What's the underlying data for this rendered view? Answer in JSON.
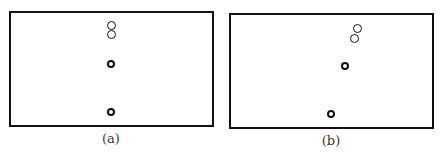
{
  "panels": [
    {
      "id": "a",
      "label": "(a)",
      "box": {
        "left": 9,
        "top": 11,
        "width": 205,
        "height": 116
      },
      "label_pos": {
        "x": 111,
        "y": 131
      },
      "circles": [
        {
          "cx": 111,
          "cy": 25,
          "r": 4.5,
          "stroke": 1.5
        },
        {
          "cx": 111,
          "cy": 34,
          "r": 4.5,
          "stroke": 1.5
        },
        {
          "cx": 111,
          "cy": 64,
          "r": 4,
          "stroke": 2
        },
        {
          "cx": 111,
          "cy": 112,
          "r": 4,
          "stroke": 2.5
        }
      ]
    },
    {
      "id": "b",
      "label": "(b)",
      "box": {
        "left": 229,
        "top": 13,
        "width": 205,
        "height": 116
      },
      "label_pos": {
        "x": 331,
        "y": 133
      },
      "circles": [
        {
          "cx": 357,
          "cy": 28,
          "r": 4.5,
          "stroke": 1.5
        },
        {
          "cx": 354,
          "cy": 38,
          "r": 4.5,
          "stroke": 1.5
        },
        {
          "cx": 345,
          "cy": 66,
          "r": 4,
          "stroke": 2
        },
        {
          "cx": 331,
          "cy": 114,
          "r": 4,
          "stroke": 2.5
        }
      ]
    }
  ]
}
